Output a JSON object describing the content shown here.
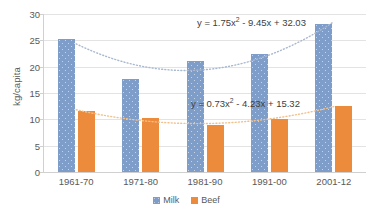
{
  "chart_data": {
    "type": "bar",
    "title": "",
    "xlabel": "",
    "ylabel": "kg/capita",
    "ylim": [
      0,
      30
    ],
    "yticks": [
      0,
      5,
      10,
      15,
      20,
      25,
      30
    ],
    "ytick_labels": [
      "0",
      "5",
      "10",
      "15",
      "20",
      "25",
      "30"
    ],
    "grid": true,
    "legend_position": "bottom",
    "categories": [
      "1961-70",
      "1971-80",
      "1981-90",
      "1991-00",
      "2001-12"
    ],
    "series": [
      {
        "name": "Milk",
        "color": "#7e9dc9",
        "values": [
          25.2,
          17.6,
          21.0,
          22.4,
          28.1
        ],
        "trendline": {
          "equation": "y = 1.75x² - 9.45x + 32.03",
          "coefficients": {
            "a": 1.75,
            "b": -9.45,
            "c": 32.03
          },
          "color": "#a8b8cf",
          "style": "dotted"
        }
      },
      {
        "name": "Beef",
        "color": "#ed8b3c",
        "values": [
          11.6,
          10.3,
          9.0,
          10.1,
          12.6
        ],
        "trendline": {
          "equation": "y = 0.73x² - 4.23x + 15.32",
          "coefficients": {
            "a": 0.73,
            "b": -4.23,
            "c": 15.32
          },
          "color": "#f2c08a",
          "style": "dotted"
        }
      }
    ],
    "annotations": [
      {
        "text": "y = 1.75x² - 9.45x + 32.03",
        "for": "Milk"
      },
      {
        "text": "y = 0.73x² - 4.23x + 15.32",
        "for": "Beef"
      }
    ]
  },
  "legend": {
    "items": [
      {
        "label": "Milk",
        "color": "#7e9dc9"
      },
      {
        "label": "Beef",
        "color": "#ed8b3c"
      }
    ]
  },
  "axis": {
    "y_title": "kg/capita"
  },
  "equations": {
    "milk_prefix": "y = 1.75x",
    "milk_sup": "2",
    "milk_suffix": " - 9.45x + 32.03",
    "beef_prefix": "y = 0.73x",
    "beef_sup": "2",
    "beef_suffix": " - 4.23x + 15.32"
  }
}
